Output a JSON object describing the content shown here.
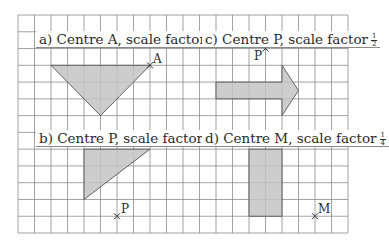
{
  "grid": {
    "origin_x": 18,
    "origin_y": 15,
    "cell_w": 16.5,
    "cell_h": 16.77,
    "cols": 20,
    "rows": 13,
    "line_color": "#8c8c8c",
    "fill_color": "#c4c4c4",
    "outline_color": "#555555"
  },
  "panels": [
    {
      "id": "a",
      "prefix": "a) Centre A, scale factor",
      "fraction": {
        "num": "1",
        "den": "3"
      },
      "centre": {
        "name": "A",
        "col": 8,
        "row": 3
      },
      "shape": {
        "type": "triangle",
        "points": [
          [
            2,
            3
          ],
          [
            8,
            3
          ],
          [
            5,
            6
          ]
        ]
      }
    },
    {
      "id": "c",
      "prefix": "c) Centre P, scale factor",
      "fraction": {
        "num": "1",
        "den": "2"
      },
      "centre": {
        "name": "P",
        "col": 15,
        "row": 2
      },
      "shape": {
        "type": "arrow",
        "points": [
          [
            12,
            4
          ],
          [
            16,
            4
          ],
          [
            16,
            3
          ],
          [
            17,
            4.5
          ],
          [
            16,
            6
          ],
          [
            16,
            5
          ],
          [
            12,
            5
          ]
        ]
      }
    },
    {
      "id": "b",
      "prefix": "b) Centre P, scale factor",
      "fraction": {
        "num": "1",
        "den": "2"
      },
      "centre": {
        "name": "P",
        "col": 6,
        "row": 12
      },
      "shape": {
        "type": "triangle",
        "points": [
          [
            4,
            8
          ],
          [
            8,
            8
          ],
          [
            4,
            11
          ]
        ]
      }
    },
    {
      "id": "d",
      "prefix": "d) Centre M, scale factor",
      "fraction": {
        "num": "1",
        "den": "4"
      },
      "centre": {
        "name": "M",
        "col": 18,
        "row": 12
      },
      "shape": {
        "type": "rectangle",
        "points": [
          [
            14,
            8
          ],
          [
            16,
            8
          ],
          [
            16,
            12
          ],
          [
            14,
            12
          ]
        ]
      }
    }
  ]
}
